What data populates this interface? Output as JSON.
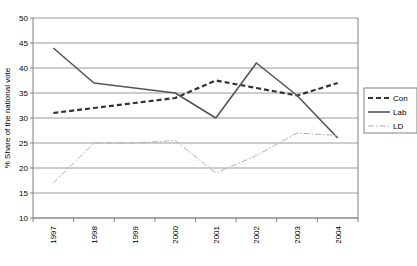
{
  "chart_data": {
    "type": "line",
    "title": "",
    "xlabel": "",
    "ylabel": "% Share of the national vote",
    "categories": [
      "1997",
      "1998",
      "1999",
      "2000",
      "2001",
      "2002",
      "2003",
      "2004"
    ],
    "ylim": [
      10,
      50
    ],
    "ytick_step": 5,
    "yticks": [
      "10",
      "15",
      "20",
      "25",
      "30",
      "35",
      "40",
      "45",
      "50"
    ],
    "grid": true,
    "legend_position": "right",
    "series": [
      {
        "name": "Con",
        "style": "dashed",
        "color": "#333333",
        "values": [
          31,
          32,
          33,
          34,
          37.5,
          36,
          34.5,
          37
        ]
      },
      {
        "name": "Lab",
        "style": "solid",
        "color": "#555555",
        "values": [
          44,
          37,
          36,
          35,
          30,
          41,
          34.5,
          26
        ]
      },
      {
        "name": "LD",
        "style": "dash-dot",
        "color": "#b0b0b0",
        "values": [
          17,
          25,
          25,
          25.5,
          19,
          22.5,
          27,
          26.5
        ]
      }
    ]
  },
  "axes": {
    "y_title": "% Share of the national vote",
    "y_tick_labels": [
      "50",
      "45",
      "40",
      "35",
      "30",
      "25",
      "20",
      "15",
      "10"
    ],
    "x_tick_labels": [
      "1997",
      "1998",
      "1999",
      "2000",
      "2001",
      "2002",
      "2003",
      "2004"
    ]
  },
  "legend": {
    "items": [
      {
        "label": "Con",
        "style": "dashed"
      },
      {
        "label": "Lab",
        "style": "solid"
      },
      {
        "label": "LD",
        "style": "dash-dot"
      }
    ]
  },
  "footer": {
    "note": ""
  }
}
